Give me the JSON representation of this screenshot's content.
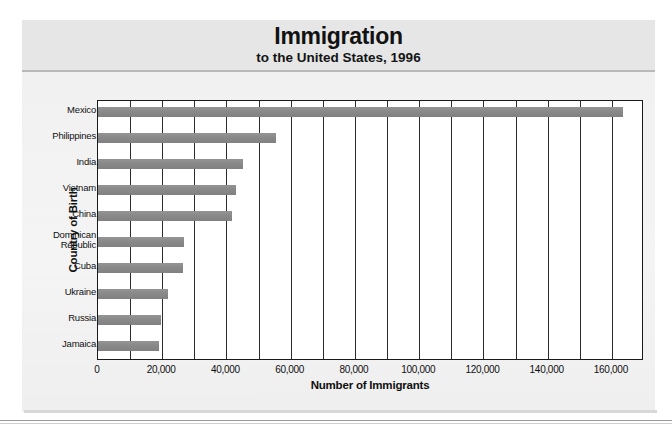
{
  "header": {
    "title": "Immigration",
    "subtitle": "to the United States, 1996"
  },
  "axes": {
    "y_title": "Country of Birth",
    "x_title": "Number of Immigrants"
  },
  "colors": {
    "bar": "#8c8c8c",
    "axis": "#1a1a1a",
    "band": "#e6e6e6",
    "panel": "#f2f2f2"
  },
  "chart_data": {
    "type": "bar",
    "orientation": "horizontal",
    "title": "Immigration",
    "subtitle": "to the United States, 1996",
    "xlabel": "Number of Immigrants",
    "ylabel": "Country of Birth",
    "xlim": [
      0,
      170000
    ],
    "grid": true,
    "gridline_interval": 10000,
    "legend": "none",
    "tick_labels": [
      "0",
      "20,000",
      "40,000",
      "60,000",
      "80,000",
      "100,000",
      "120,000",
      "140,000",
      "160,000"
    ],
    "ticks": [
      0,
      20000,
      40000,
      60000,
      80000,
      100000,
      120000,
      140000,
      160000
    ],
    "categories": [
      "Mexico",
      "Philippines",
      "India",
      "Vietnam",
      "China",
      "Dominican Republic",
      "Cuba",
      "Ukraine",
      "Russia",
      "Jamaica"
    ],
    "category_lines": [
      [
        "Mexico"
      ],
      [
        "Philippines"
      ],
      [
        "India"
      ],
      [
        "Vietnam"
      ],
      [
        "China"
      ],
      [
        "Dominican",
        "Republic"
      ],
      [
        "Cuba"
      ],
      [
        "Ukraine"
      ],
      [
        "Russia"
      ],
      [
        "Jamaica"
      ]
    ],
    "values": [
      163500,
      55500,
      45300,
      43000,
      41700,
      26800,
      26500,
      21700,
      19500,
      19000
    ]
  }
}
